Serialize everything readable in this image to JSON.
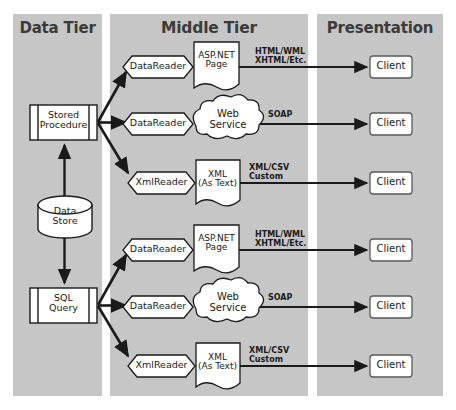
{
  "diagram": {
    "colors": {
      "panel_bg": "#c6c6c6",
      "page_bg": "#ffffff",
      "shape_fill": "#ffffff",
      "stroke": "#1a1a1a",
      "title_text": "#3b3b3b"
    }
  },
  "tiers": [
    {
      "id": "data",
      "title": "Data Tier"
    },
    {
      "id": "middle",
      "title": "Middle Tier"
    },
    {
      "id": "presentation",
      "title": "Presentation"
    }
  ],
  "data_tier": {
    "stored_procedure": {
      "line1": "Stored",
      "line2": "Procedure",
      "shape": "predefined-process"
    },
    "data_store": {
      "line1": "Data",
      "line2": "Store",
      "shape": "cylinder"
    },
    "sql_query": {
      "line1": "SQL",
      "line2": "Query",
      "shape": "predefined-process"
    }
  },
  "middle_tier": {
    "rows": [
      {
        "reader": "DataReader",
        "reader_shape": "hexagon",
        "processor_line1": "ASP.NET",
        "processor_line2": "Page",
        "processor_shape": "document",
        "output_line1": "HTML/WML",
        "output_line2": "XHTML/Etc.",
        "source": "stored_procedure"
      },
      {
        "reader": "DataReader",
        "reader_shape": "hexagon",
        "processor_line1": "Web",
        "processor_line2": "Service",
        "processor_shape": "cloud",
        "output_line1": "SOAP",
        "output_line2": "",
        "source": "stored_procedure"
      },
      {
        "reader": "XmlReader",
        "reader_shape": "hexagon",
        "processor_line1": "XML",
        "processor_line2": "(As Text)",
        "processor_shape": "document",
        "output_line1": "XML/CSV",
        "output_line2": "Custom",
        "source": "stored_procedure"
      },
      {
        "reader": "DataReader",
        "reader_shape": "hexagon",
        "processor_line1": "ASP.NET",
        "processor_line2": "Page",
        "processor_shape": "document",
        "output_line1": "HTML/WML",
        "output_line2": "XHTML/Etc.",
        "source": "sql_query"
      },
      {
        "reader": "DataReader",
        "reader_shape": "hexagon",
        "processor_line1": "Web",
        "processor_line2": "Service",
        "processor_shape": "cloud",
        "output_line1": "SOAP",
        "output_line2": "",
        "source": "sql_query"
      },
      {
        "reader": "XmlReader",
        "reader_shape": "hexagon",
        "processor_line1": "XML",
        "processor_line2": "(As Text)",
        "processor_shape": "document",
        "output_line1": "XML/CSV",
        "output_line2": "Custom",
        "source": "sql_query"
      }
    ]
  },
  "presentation_tier": {
    "clients": [
      {
        "label": "Client"
      },
      {
        "label": "Client"
      },
      {
        "label": "Client"
      },
      {
        "label": "Client"
      },
      {
        "label": "Client"
      },
      {
        "label": "Client"
      }
    ]
  }
}
